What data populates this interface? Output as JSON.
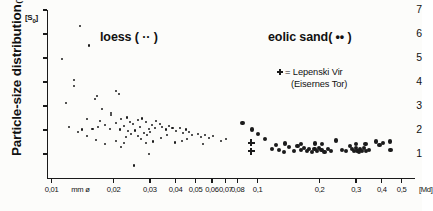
{
  "chart_data": {
    "type": "scatter",
    "title": "",
    "ylabel": "Particle-size distribution",
    "ylabel_suffix": "(TRASK)",
    "y_symbol": "[S0]",
    "xlabel_left": "mm ø",
    "xlabel_right": "[Md]",
    "xscale": "log",
    "xlim": [
      0.0095,
      0.58
    ],
    "ylim": [
      0,
      7
    ],
    "yticks": [
      1,
      2,
      3,
      4,
      5,
      6,
      7
    ],
    "ytick_labels": [
      "1",
      "2",
      "3",
      "4",
      "5",
      "6",
      "7"
    ],
    "xticks": [
      0.01,
      0.02,
      0.03,
      0.04,
      0.05,
      0.06,
      0.07,
      0.08,
      0.1,
      0.2,
      0.3,
      0.4,
      0.5
    ],
    "xtick_labels": [
      "0,01",
      "0,02",
      "0,03",
      "0,04",
      "0,05",
      "0,06",
      "0,07",
      "0,08",
      "0,1",
      "0,2",
      "0,3",
      "0,4",
      "0,5"
    ],
    "grid": false,
    "legend_position": "inside-upper-right",
    "series": [
      {
        "name": "loess",
        "label": "loess ( ·· )",
        "marker": "small-dot",
        "points": [
          [
            0.0138,
            6.35
          ],
          [
            0.0152,
            5.52
          ],
          [
            0.0112,
            4.97
          ],
          [
            0.0128,
            4.08
          ],
          [
            0.0128,
            3.82
          ],
          [
            0.0118,
            3.14
          ],
          [
            0.0166,
            3.42
          ],
          [
            0.0163,
            3.3
          ],
          [
            0.0205,
            3.62
          ],
          [
            0.0212,
            3.5
          ],
          [
            0.0176,
            2.88
          ],
          [
            0.0195,
            2.62
          ],
          [
            0.0172,
            2.38
          ],
          [
            0.0181,
            2.22
          ],
          [
            0.0168,
            2.12
          ],
          [
            0.0158,
            2.06
          ],
          [
            0.0192,
            2.05
          ],
          [
            0.0205,
            2.3
          ],
          [
            0.0218,
            2.46
          ],
          [
            0.0232,
            2.52
          ],
          [
            0.0241,
            2.34
          ],
          [
            0.0225,
            2.18
          ],
          [
            0.0214,
            2.02
          ],
          [
            0.0236,
            1.95
          ],
          [
            0.0248,
            2.25
          ],
          [
            0.0262,
            2.42
          ],
          [
            0.0275,
            2.48
          ],
          [
            0.0288,
            2.32
          ],
          [
            0.0268,
            2.12
          ],
          [
            0.0255,
            1.98
          ],
          [
            0.0243,
            1.82
          ],
          [
            0.0229,
            1.72
          ],
          [
            0.0262,
            1.76
          ],
          [
            0.0281,
            1.88
          ],
          [
            0.0296,
            2.05
          ],
          [
            0.0308,
            2.22
          ],
          [
            0.0322,
            2.36
          ],
          [
            0.0336,
            2.26
          ],
          [
            0.0316,
            2.08
          ],
          [
            0.0301,
            1.92
          ],
          [
            0.0289,
            1.78
          ],
          [
            0.0272,
            1.62
          ],
          [
            0.0218,
            1.3
          ],
          [
            0.0195,
            2.72
          ],
          [
            0.0149,
            2.45
          ],
          [
            0.0141,
            2.02
          ],
          [
            0.0345,
            2.14
          ],
          [
            0.0358,
            2.02
          ],
          [
            0.0372,
            2.18
          ],
          [
            0.0386,
            2.08
          ],
          [
            0.0402,
            1.95
          ],
          [
            0.0418,
            2.1
          ],
          [
            0.0362,
            1.8
          ],
          [
            0.0338,
            1.66
          ],
          [
            0.0311,
            1.52
          ],
          [
            0.0288,
            1.44
          ],
          [
            0.0432,
            1.88
          ],
          [
            0.0448,
            2.02
          ],
          [
            0.0465,
            1.92
          ],
          [
            0.0482,
            1.78
          ],
          [
            0.0455,
            1.62
          ],
          [
            0.0428,
            1.55
          ],
          [
            0.0398,
            1.48
          ],
          [
            0.0512,
            1.85
          ],
          [
            0.0532,
            1.72
          ],
          [
            0.0556,
            1.8
          ],
          [
            0.0578,
            1.66
          ],
          [
            0.0608,
            1.74
          ],
          [
            0.0252,
            0.52
          ],
          [
            0.0298,
            1.0
          ],
          [
            0.0182,
            1.42
          ],
          [
            0.0165,
            1.58
          ],
          [
            0.0148,
            1.74
          ],
          [
            0.0135,
            1.92
          ],
          [
            0.0122,
            2.12
          ],
          [
            0.0206,
            1.55
          ],
          [
            0.0225,
            1.46
          ],
          [
            0.0665,
            1.55
          ],
          [
            0.0705,
            1.62
          ],
          [
            0.0545,
            1.42
          ]
        ]
      },
      {
        "name": "eolic sand",
        "label": "eolic sand( •• )",
        "marker": "large-dot",
        "points": [
          [
            0.0845,
            2.3
          ],
          [
            0.0935,
            2.02
          ],
          [
            0.1005,
            1.82
          ],
          [
            0.1085,
            1.64
          ],
          [
            0.1175,
            1.22
          ],
          [
            0.1268,
            1.18
          ],
          [
            0.1342,
            1.08
          ],
          [
            0.1425,
            1.28
          ],
          [
            0.1498,
            1.12
          ],
          [
            0.1562,
            1.34
          ],
          [
            0.1618,
            1.18
          ],
          [
            0.1672,
            1.26
          ],
          [
            0.1728,
            1.14
          ],
          [
            0.1782,
            1.22
          ],
          [
            0.1835,
            1.1
          ],
          [
            0.1888,
            1.2
          ],
          [
            0.1938,
            1.12
          ],
          [
            0.1985,
            1.26
          ],
          [
            0.2042,
            1.16
          ],
          [
            0.2108,
            1.08
          ],
          [
            0.2185,
            1.22
          ],
          [
            0.2262,
            1.14
          ],
          [
            0.2392,
            1.56
          ],
          [
            0.2565,
            1.18
          ],
          [
            0.2682,
            1.12
          ],
          [
            0.2795,
            1.32
          ],
          [
            0.2872,
            1.2
          ],
          [
            0.2938,
            1.12
          ],
          [
            0.2992,
            1.24
          ],
          [
            0.3048,
            1.14
          ],
          [
            0.3098,
            1.08
          ],
          [
            0.3148,
            1.2
          ],
          [
            0.3205,
            1.12
          ],
          [
            0.3268,
            1.26
          ],
          [
            0.3352,
            1.14
          ],
          [
            0.3485,
            1.18
          ],
          [
            0.3762,
            1.52
          ],
          [
            0.3905,
            1.38
          ],
          [
            0.4062,
            1.46
          ],
          [
            0.4385,
            1.52
          ],
          [
            0.4412,
            1.18
          ],
          [
            0.1228,
            1.36
          ],
          [
            0.1352,
            1.44
          ],
          [
            0.2048,
            1.42
          ],
          [
            0.3012,
            1.4
          ],
          [
            0.3338,
            1.42
          ],
          [
            0.1622,
            1.42
          ],
          [
            0.1905,
            1.44
          ]
        ]
      },
      {
        "name": "Lepenski Vir",
        "label": "= Lepenski Vir",
        "sublabel": "(Eisernes Tor)",
        "marker": "plus",
        "points": [
          [
            0.0932,
            1.46
          ],
          [
            0.0932,
            1.12
          ]
        ]
      }
    ]
  }
}
